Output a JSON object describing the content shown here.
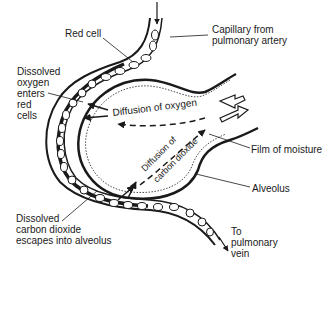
{
  "diagram": {
    "type": "labeled-anatomical-diagram",
    "labels": {
      "red_cell": "Red cell",
      "capillary_from": "Capillary from\npulmonary artery",
      "dissolved_oxygen": "Dissolved\noxygen\nenters\nred\ncells",
      "diffusion_oxygen": "Diffusion of oxygen",
      "diffusion_co2_line1": "Diffusion of",
      "diffusion_co2_line2": "carbon dioxide",
      "film_of_moisture": "Film of moisture",
      "alveolus": "Alveolus",
      "dissolved_co2": "Dissolved\ncarbon dioxide\nescapes into alveolus",
      "to_pulmonary_vein": "To\npulmonary\nvein"
    },
    "colors": {
      "ink": "#1a1a1a",
      "background": "#ffffff"
    }
  }
}
